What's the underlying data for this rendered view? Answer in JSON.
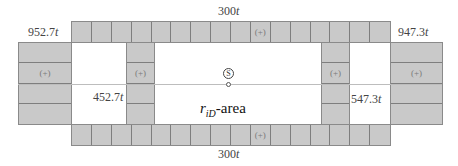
{
  "diagram": {
    "colors": {
      "cell_fill": "#c9c9c9",
      "cell_border": "#7e7e7e",
      "background": "#ffffff",
      "text": "#444444"
    },
    "labels": {
      "top_center": {
        "value": "300",
        "unit": "t"
      },
      "bottom_center": {
        "value": "300",
        "unit": "t"
      },
      "top_left": {
        "value": "952.7",
        "unit": "t"
      },
      "top_right": {
        "value": "947.3",
        "unit": "t"
      },
      "inner_left": {
        "value": "452.7",
        "unit": "t"
      },
      "inner_right": {
        "value": "547.3",
        "unit": "t"
      }
    },
    "area_label": {
      "symbol": "r",
      "subscript": "iD",
      "suffix": "-area"
    },
    "center_marker": {
      "glyph": "S"
    },
    "plus_mark": "(+)",
    "top_strip": {
      "cells": 16,
      "plus_index": 9
    },
    "bottom_strip": {
      "cells": 16,
      "plus_index": 9
    },
    "left_block": {
      "rows": 4,
      "plus_index": 1
    },
    "right_block": {
      "rows": 4,
      "plus_index": 1
    },
    "inner_left_column": {
      "rows": 4,
      "plus_index": 1
    },
    "inner_right_column": {
      "rows": 4,
      "plus_index": 1
    }
  }
}
